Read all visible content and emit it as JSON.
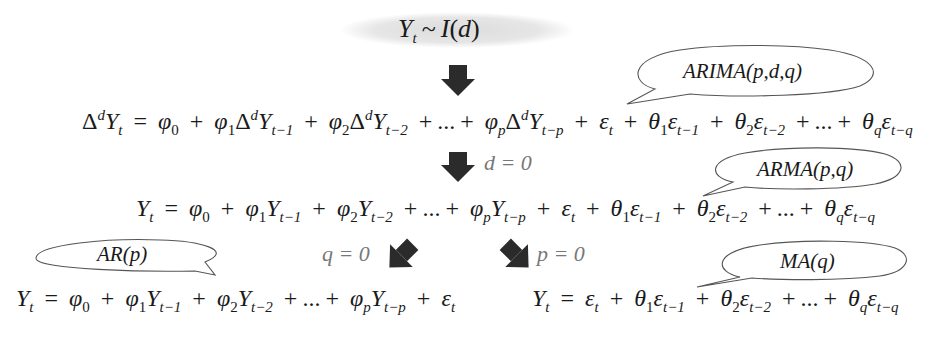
{
  "top": {
    "label": "Y_t ~ I(d)"
  },
  "bubbles": {
    "arima": "ARIMA(p,d,q)",
    "arma": "ARMA(p,q)",
    "ar": "AR(p)",
    "ma": "MA(q)"
  },
  "conditions": {
    "d": "d = 0",
    "q": "q = 0",
    "p": "p = 0"
  },
  "equations": {
    "arima": "Δ^d Y_t = φ_0 + φ_1 Δ^d Y_{t-1} + φ_2 Δ^d Y_{t-2} + ... + φ_p Δ^d Y_{t-p} + ε_t + θ_1 ε_{t-1} + θ_2 ε_{t-2} + ... + θ_q ε_{t-q}",
    "arma": "Y_t = φ_0 + φ_1 Y_{t-1} + φ_2 Y_{t-2} + ... + φ_p Y_{t-p} + ε_t + θ_1 ε_{t-1} + θ_2 ε_{t-2} + ... + θ_q ε_{t-q}",
    "ar": "Y_t = φ_0 + φ_1 Y_{t-1} + φ_2 Y_{t-2} + ... + φ_p Y_{t-p} + ε_t",
    "ma": "Y_t = ε_t + θ_1 ε_{t-1} + θ_2 ε_{t-2} + ... + θ_q ε_{t-q}"
  },
  "symbols": {
    "Y": "Y",
    "t": "t",
    "tilde": "~",
    "I": "I",
    "d": "d",
    "lp": "(",
    "rp": ")",
    "delta": "Δ",
    "eq": "=",
    "plus": "+",
    "dots": "...",
    "phi": "φ",
    "theta": "θ",
    "eps": "ε",
    "s0": "0",
    "s1": "1",
    "s2": "2",
    "p": "p",
    "q": "q",
    "tm1": "t−1",
    "tm2": "t−2",
    "tmp": "t−p",
    "tmq": "t−q"
  },
  "colors": {
    "arrow": "#2b2b2b",
    "ellipse_fill": "#e6e6e6",
    "bubble_stroke": "#555555",
    "condition_text": "#777777",
    "text": "#1a1a1a"
  }
}
